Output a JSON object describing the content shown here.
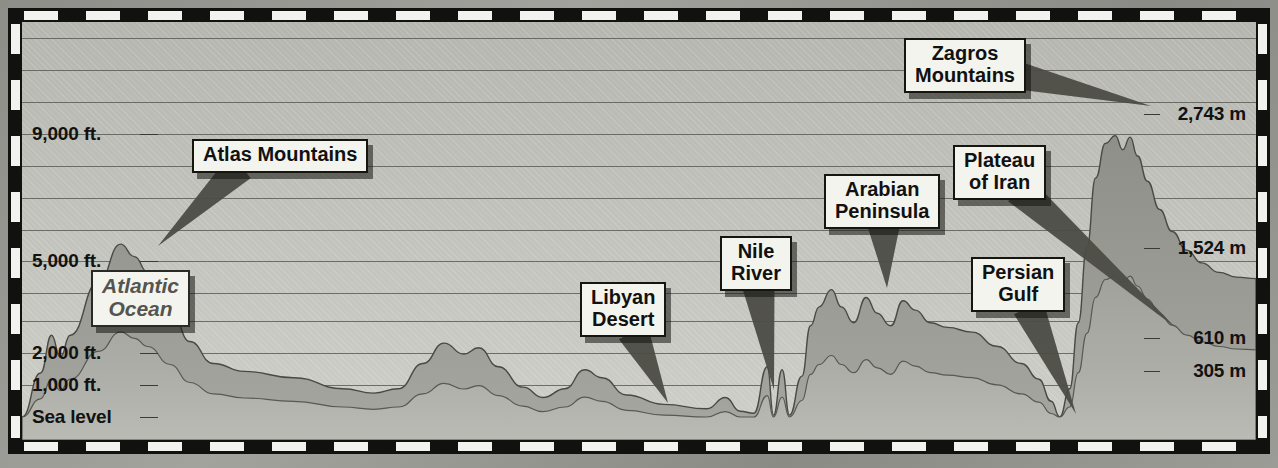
{
  "figure": {
    "caption": "West to East at about 30°N latitude",
    "caption_left_rule": true,
    "caption_right_arrow": true
  },
  "axes": {
    "left_unit": "ft.",
    "right_unit": "m",
    "left_ticks": [
      {
        "label": "9,000 ft.",
        "value": 9000,
        "y": 126
      },
      {
        "label": "5,000 ft.",
        "value": 5000,
        "y": 253
      },
      {
        "label": "2,000 ft.",
        "value": 2000,
        "y": 345
      },
      {
        "label": "1,000 ft.",
        "value": 1000,
        "y": 377
      },
      {
        "label": "Sea level",
        "value": 0,
        "y": 409
      }
    ],
    "right_ticks": [
      {
        "label": "2,743 m",
        "value": 2743,
        "y": 106
      },
      {
        "label": "1,524 m",
        "value": 1524,
        "y": 240
      },
      {
        "label": "610 m",
        "value": 610,
        "y": 330
      },
      {
        "label": "305 m",
        "value": 305,
        "y": 363
      }
    ],
    "gridline_y": [
      30,
      62,
      94,
      126,
      158,
      190,
      222,
      253,
      285,
      313,
      345,
      377,
      409,
      437
    ]
  },
  "callouts": [
    {
      "name": "atlas-mountains",
      "text": "Atlas Mountains",
      "x": 184,
      "y": 131,
      "style": "solid"
    },
    {
      "name": "atlantic-ocean",
      "text": "Atlantic\nOcean",
      "x": 83,
      "y": 262,
      "style": "ocean"
    },
    {
      "name": "libyan-desert",
      "text": "Libyan\nDesert",
      "x": 572,
      "y": 274,
      "style": "solid"
    },
    {
      "name": "nile-river",
      "text": "Nile\nRiver",
      "x": 712,
      "y": 228,
      "style": "solid"
    },
    {
      "name": "arabian-peninsula",
      "text": "Arabian\nPeninsula",
      "x": 816,
      "y": 166,
      "style": "solid"
    },
    {
      "name": "zagros-mountains",
      "text": "Zagros\nMountains",
      "x": 896,
      "y": 30,
      "style": "solid"
    },
    {
      "name": "plateau-of-iran",
      "text": "Plateau\nof Iran",
      "x": 945,
      "y": 137,
      "style": "solid"
    },
    {
      "name": "persian-gulf",
      "text": "Persian\nGulf",
      "x": 963,
      "y": 249,
      "style": "solid"
    }
  ],
  "chart_data": {
    "type": "area",
    "xlabel": "West to East at about 30°N latitude",
    "ylabel": "Elevation",
    "ylim": [
      0,
      12000
    ],
    "y_unit_primary": "ft.",
    "y_unit_secondary": "m",
    "grid": true,
    "legend": "none",
    "features": [
      "Atlantic Ocean",
      "Atlas Mountains",
      "Libyan Desert",
      "Nile River",
      "Arabian Peninsula",
      "Persian Gulf",
      "Plateau of Iran",
      "Zagros Mountains"
    ],
    "y_tick_labels_ft": [
      "Sea level",
      "1,000 ft.",
      "2,000 ft.",
      "5,000 ft.",
      "9,000 ft."
    ],
    "y_tick_labels_m": [
      "305 m",
      "610 m",
      "1,524 m",
      "2,743 m"
    ],
    "peaks": [
      {
        "name": "Atlas Mountains",
        "elevation_ft": 5400,
        "x_pct": 11
      },
      {
        "name": "Saharan upland",
        "elevation_ft": 2300,
        "x_pct": 34
      },
      {
        "name": "Libyan Desert low",
        "elevation_ft": 900,
        "x_pct": 50
      },
      {
        "name": "Arabian Peninsula",
        "elevation_ft": 4100,
        "x_pct": 68
      },
      {
        "name": "Persian Gulf",
        "elevation_ft": 0,
        "x_pct": 84
      },
      {
        "name": "Zagros Mountains",
        "elevation_ft": 9000,
        "x_pct": 90
      }
    ],
    "profile_points": [
      [
        0,
        0
      ],
      [
        1.5,
        1400
      ],
      [
        2.4,
        2600
      ],
      [
        3.1,
        1900
      ],
      [
        3.9,
        2600
      ],
      [
        6.2,
        4300
      ],
      [
        8.0,
        5500
      ],
      [
        9.1,
        5100
      ],
      [
        10.2,
        4600
      ],
      [
        12.0,
        3500
      ],
      [
        13.6,
        2400
      ],
      [
        15.5,
        1700
      ],
      [
        18.0,
        1450
      ],
      [
        22.0,
        1250
      ],
      [
        26.0,
        900
      ],
      [
        28.5,
        760
      ],
      [
        30.5,
        900
      ],
      [
        32.5,
        1700
      ],
      [
        34.2,
        2350
      ],
      [
        35.8,
        2000
      ],
      [
        37.0,
        2200
      ],
      [
        38.6,
        1600
      ],
      [
        40.6,
        950
      ],
      [
        42.2,
        620
      ],
      [
        44.0,
        900
      ],
      [
        45.6,
        1500
      ],
      [
        47.0,
        1250
      ],
      [
        49.0,
        700
      ],
      [
        52.0,
        400
      ],
      [
        55.5,
        260
      ],
      [
        57.0,
        620
      ],
      [
        58.2,
        180
      ],
      [
        59.3,
        120
      ],
      [
        60.4,
        1600
      ],
      [
        60.9,
        60
      ],
      [
        61.6,
        1500
      ],
      [
        62.2,
        60
      ],
      [
        63.2,
        1300
      ],
      [
        63.9,
        2900
      ],
      [
        64.6,
        3500
      ],
      [
        65.6,
        4050
      ],
      [
        66.4,
        3500
      ],
      [
        67.4,
        3000
      ],
      [
        68.4,
        3800
      ],
      [
        69.3,
        3300
      ],
      [
        70.4,
        2900
      ],
      [
        71.4,
        3700
      ],
      [
        72.4,
        3400
      ],
      [
        73.6,
        3000
      ],
      [
        75.0,
        2850
      ],
      [
        77.0,
        2700
      ],
      [
        79.0,
        2250
      ],
      [
        81.0,
        1700
      ],
      [
        82.4,
        1200
      ],
      [
        83.4,
        500
      ],
      [
        84.1,
        0
      ],
      [
        84.9,
        900
      ],
      [
        85.6,
        3000
      ],
      [
        86.3,
        5400
      ],
      [
        87.0,
        7600
      ],
      [
        87.8,
        8700
      ],
      [
        88.6,
        8950
      ],
      [
        89.2,
        8500
      ],
      [
        89.8,
        8900
      ],
      [
        90.4,
        8300
      ],
      [
        91.2,
        7500
      ],
      [
        92.2,
        6600
      ],
      [
        93.2,
        5900
      ],
      [
        94.4,
        5300
      ],
      [
        95.6,
        4900
      ],
      [
        97.0,
        4600
      ],
      [
        98.4,
        4450
      ],
      [
        100,
        4400
      ]
    ]
  }
}
